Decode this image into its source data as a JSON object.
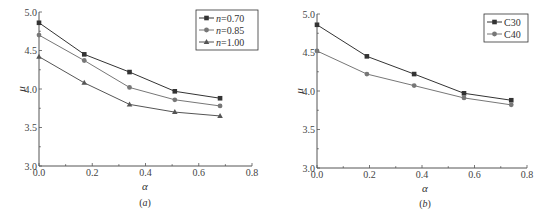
{
  "chart_data": [
    {
      "type": "line",
      "panel_label": "(a)",
      "title": "",
      "xlabel": "α",
      "ylabel": "μ",
      "xlim": [
        0.0,
        0.8
      ],
      "ylim": [
        3.0,
        5.0
      ],
      "xticks": [
        "0.0",
        "0.2",
        "0.4",
        "0.6",
        "0.8"
      ],
      "yticks": [
        "3.0",
        "3.5",
        "4.0",
        "4.5",
        "5.0"
      ],
      "grid": false,
      "legend_position": "upper right",
      "x": [
        0.0,
        0.17,
        0.34,
        0.51,
        0.68
      ],
      "series": [
        {
          "name": "n=0.70",
          "name_italic": "n",
          "name_rest": "=0.70",
          "marker": "square",
          "color": "#333333",
          "values": [
            4.86,
            4.45,
            4.22,
            3.97,
            3.88
          ]
        },
        {
          "name": "n=0.85",
          "name_italic": "n",
          "name_rest": "=0.85",
          "marker": "circle",
          "color": "#777777",
          "values": [
            4.7,
            4.37,
            4.02,
            3.86,
            3.78
          ]
        },
        {
          "name": "n=1.00",
          "name_italic": "n",
          "name_rest": "=1.00",
          "marker": "triangle",
          "color": "#555555",
          "values": [
            4.42,
            4.08,
            3.8,
            3.7,
            3.65
          ]
        }
      ]
    },
    {
      "type": "line",
      "panel_label": "(b)",
      "title": "",
      "xlabel": "α",
      "ylabel": "μ",
      "xlim": [
        0.0,
        0.8
      ],
      "ylim": [
        3.0,
        5.0
      ],
      "xticks": [
        "0.0",
        "0.2",
        "0.4",
        "0.6",
        "0.8"
      ],
      "yticks": [
        "3.0",
        "3.5",
        "4.0",
        "4.5",
        "5.0"
      ],
      "grid": false,
      "legend_position": "upper right",
      "x": [
        0.0,
        0.19,
        0.37,
        0.56,
        0.74
      ],
      "series": [
        {
          "name": "C30",
          "marker": "square",
          "color": "#333333",
          "values": [
            4.86,
            4.45,
            4.22,
            3.97,
            3.88
          ]
        },
        {
          "name": "C40",
          "marker": "circle",
          "color": "#777777",
          "values": [
            4.52,
            4.22,
            4.07,
            3.91,
            3.82
          ]
        }
      ]
    }
  ]
}
